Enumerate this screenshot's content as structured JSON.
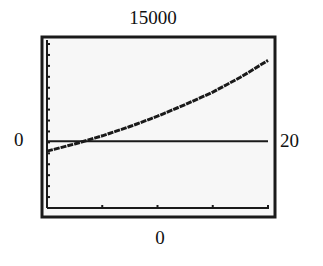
{
  "window": {
    "ymax_label": "15000",
    "ymin_label": "0",
    "xmin_label": "0",
    "xmax_label": "20"
  },
  "colors": {
    "frame": "#1a1a1a",
    "screen_bg": "#f7f7f7",
    "curve": "#1a1a1a"
  },
  "chart_data": {
    "type": "line",
    "title": "",
    "xlabel": "",
    "ylabel": "",
    "xlim": [
      0,
      20
    ],
    "ylim": [
      0,
      15000
    ],
    "x_tick_step": 5,
    "y_tick_step": 1000,
    "grid": false,
    "legend": "none",
    "window_labels": {
      "top": "15000",
      "bottom": "0",
      "left": "0",
      "right": "20"
    },
    "series": [
      {
        "name": "curve",
        "style": "pixelated increasing convex curve",
        "x": [
          0,
          2.5,
          5,
          7.5,
          10,
          12.5,
          15,
          17.5,
          20
        ],
        "y": [
          5200,
          5850,
          6600,
          7450,
          8400,
          9450,
          10600,
          11950,
          13500
        ]
      },
      {
        "name": "horizontal-line",
        "style": "constant line",
        "x": [
          0,
          20
        ],
        "y": [
          6100,
          6100
        ]
      }
    ]
  }
}
